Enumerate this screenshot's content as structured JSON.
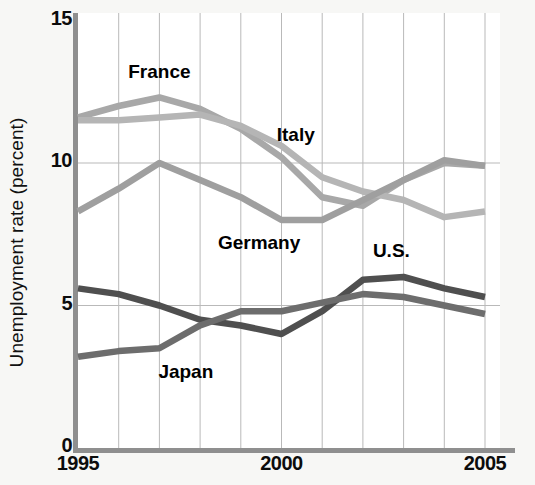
{
  "chart_data": {
    "type": "line",
    "title": "",
    "subtitle": "",
    "xlabel": "",
    "ylabel": "Unemployment rate (percent)",
    "x": [
      1995,
      1996,
      1997,
      1998,
      1999,
      2000,
      2001,
      2002,
      2003,
      2004,
      2005
    ],
    "xlim": [
      1995,
      2005
    ],
    "ylim": [
      0,
      15
    ],
    "ytick_labels": [
      "0",
      "5",
      "10",
      "15"
    ],
    "yticks": [
      0,
      5,
      10,
      15
    ],
    "xtick_labels": [
      "1995",
      "2000",
      "2005"
    ],
    "xticks": [
      1995,
      2000,
      2005
    ],
    "grid": "both",
    "grid_color": "#b9b9b9",
    "legend": "inline-annotations",
    "series": [
      {
        "name": "France",
        "color": "#a8a8a8",
        "label_x": 1997.0,
        "label_y": 13.2,
        "values": [
          11.6,
          12.0,
          12.3,
          11.9,
          11.2,
          10.2,
          8.8,
          8.5,
          9.4,
          10.0,
          9.9
        ]
      },
      {
        "name": "Italy",
        "color": "#b5b5b5",
        "label_x": 2000.35,
        "label_y": 11.0,
        "values": [
          11.5,
          11.5,
          11.6,
          11.7,
          11.3,
          10.6,
          9.5,
          9.0,
          8.7,
          8.1,
          8.3
        ]
      },
      {
        "name": "Germany",
        "color": "#9f9f9f",
        "label_x": 1999.45,
        "label_y": 7.2,
        "values": [
          8.3,
          9.1,
          10.0,
          9.4,
          8.8,
          8.0,
          8.0,
          8.7,
          9.4,
          10.1,
          9.9
        ]
      },
      {
        "name": "U.S.",
        "color": "#4f4f4f",
        "label_x": 2002.7,
        "label_y": 6.9,
        "values": [
          5.6,
          5.4,
          5.0,
          4.5,
          4.3,
          4.0,
          4.8,
          5.9,
          6.0,
          5.6,
          5.3
        ]
      },
      {
        "name": "Japan",
        "color": "#6d6d6d",
        "label_x": 1997.65,
        "label_y": 2.65,
        "values": [
          3.2,
          3.4,
          3.5,
          4.3,
          4.8,
          4.8,
          5.1,
          5.4,
          5.3,
          5.0,
          4.7
        ]
      }
    ]
  }
}
